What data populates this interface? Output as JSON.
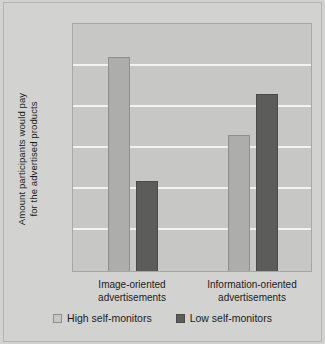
{
  "chart_data": {
    "type": "bar",
    "title": "",
    "xlabel": "",
    "ylabel": "Amount participants would pay\nfor the advertised products",
    "categories": [
      "Image-oriented\nadvertisements",
      "Information-oriented\nadvertisements"
    ],
    "series": [
      {
        "name": "High self-monitors",
        "values": [
          14.15,
          12.25
        ],
        "color": "#adadab"
      },
      {
        "name": "Low self-monitors",
        "values": [
          11.12,
          13.25
        ],
        "color": "#5c5c5a"
      }
    ],
    "ylim": [
      8.93,
      15
    ],
    "yticks": [
      10,
      11,
      12,
      13,
      14,
      15
    ],
    "ytick_labels": [
      "$10",
      "$11",
      "$12",
      "$13",
      "$14",
      "$15"
    ],
    "grid": true,
    "legend_position": "bottom",
    "plot_background": "#c7c7c5",
    "figure_background": "#d2d2d0",
    "gridline_color": "#f2f2f0"
  },
  "legend": [
    {
      "label": "High self-monitors"
    },
    {
      "label": "Low self-monitors"
    }
  ]
}
